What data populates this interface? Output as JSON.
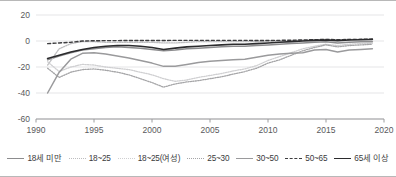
{
  "chart_data": {
    "type": "line",
    "title": "",
    "xlabel": "",
    "ylabel": "",
    "xlim": [
      1990,
      2020
    ],
    "ylim": [
      -60,
      20
    ],
    "xticks": [
      "1990",
      "1995",
      "2000",
      "2005",
      "2010",
      "2015",
      "2020"
    ],
    "yticks": [
      "20",
      "0",
      "-20",
      "-40",
      "-60"
    ],
    "grid": true,
    "legend_position": "bottom",
    "x": [
      1991,
      1992,
      1993,
      1994,
      1995,
      1996,
      1997,
      1998,
      1999,
      2000,
      2001,
      2002,
      2003,
      2004,
      2005,
      2006,
      2007,
      2008,
      2009,
      2010,
      2011,
      2012,
      2013,
      2014,
      2015,
      2016,
      2017,
      2018,
      2019
    ],
    "series": [
      {
        "name": "18세 미만",
        "color": "#8c8c8e",
        "style": "solid",
        "width": 1.5,
        "values": [
          -14.5,
          -11.5,
          -9.0,
          -7.0,
          -6.0,
          -5.0,
          -4.5,
          -5.0,
          -5.5,
          -6.5,
          -7.5,
          -7.0,
          -6.0,
          -5.5,
          -5.0,
          -4.5,
          -4.0,
          -4.0,
          -3.5,
          -3.0,
          -2.5,
          -2.0,
          -1.5,
          -1.0,
          -0.5,
          -1.5,
          -1.0,
          -0.5,
          -0.5
        ]
      },
      {
        "name": "18~25",
        "color": "#bdbdbf",
        "style": "dotted",
        "width": 1.3,
        "values": [
          -18.5,
          -6.0,
          -2.0,
          -0.5,
          -0.5,
          -1.0,
          -1.0,
          -1.0,
          -1.0,
          -1.0,
          -1.5,
          -1.5,
          -1.0,
          -0.5,
          -0.5,
          -0.5,
          -0.5,
          -0.5,
          -0.5,
          0.0,
          0.0,
          0.3,
          0.5,
          1.0,
          1.2,
          1.0,
          1.2,
          1.3,
          1.5
        ]
      },
      {
        "name": "18~25(여성)",
        "color": "#cfcfd1",
        "style": "dotted",
        "width": 1.3,
        "values": [
          -16.0,
          -23.5,
          -20.0,
          -18.0,
          -18.5,
          -20.0,
          -21.0,
          -22.0,
          -24.0,
          -26.0,
          -29.0,
          -31.0,
          -30.0,
          -28.0,
          -26.5,
          -25.0,
          -23.0,
          -21.5,
          -19.0,
          -15.0,
          -12.0,
          -9.0,
          -6.0,
          -4.0,
          -2.5,
          -3.5,
          -2.5,
          -2.0,
          -2.0
        ]
      },
      {
        "name": "25~30",
        "color": "#a5a5a7",
        "style": "dotted",
        "width": 1.3,
        "values": [
          -21.0,
          -28.0,
          -24.0,
          -22.0,
          -21.5,
          -22.5,
          -24.0,
          -26.0,
          -29.0,
          -32.0,
          -35.5,
          -33.0,
          -31.5,
          -30.5,
          -29.0,
          -27.5,
          -25.5,
          -23.5,
          -21.0,
          -17.0,
          -14.5,
          -11.0,
          -7.5,
          -5.0,
          -3.0,
          -4.5,
          -3.5,
          -3.0,
          -2.5
        ]
      },
      {
        "name": "30~50",
        "color": "#9a9a9c",
        "style": "solid",
        "width": 1.5,
        "values": [
          -40.0,
          -24.0,
          -14.0,
          -9.5,
          -9.0,
          -10.0,
          -11.5,
          -13.0,
          -15.0,
          -17.0,
          -19.5,
          -19.5,
          -18.0,
          -16.5,
          -15.5,
          -15.0,
          -14.5,
          -14.0,
          -12.5,
          -11.0,
          -10.0,
          -9.5,
          -9.0,
          -7.0,
          -6.5,
          -8.5,
          -7.0,
          -6.5,
          -6.0
        ]
      },
      {
        "name": "50~65",
        "color": "#3d3d3f",
        "style": "dashed",
        "width": 1.4,
        "values": [
          -2.0,
          -1.5,
          -1.0,
          0.0,
          0.2,
          0.3,
          0.3,
          0.4,
          0.4,
          0.4,
          0.4,
          0.5,
          0.5,
          0.5,
          0.5,
          0.5,
          0.5,
          0.5,
          0.4,
          0.4,
          0.5,
          0.6,
          0.8,
          1.0,
          1.2,
          1.0,
          1.2,
          1.3,
          1.5
        ]
      },
      {
        "name": "65세 이상",
        "color": "#2b2b2d",
        "style": "solid",
        "width": 1.6,
        "values": [
          -13.5,
          -11.0,
          -8.5,
          -6.5,
          -5.0,
          -4.0,
          -3.5,
          -3.5,
          -4.0,
          -5.0,
          -6.5,
          -5.5,
          -4.5,
          -4.0,
          -3.5,
          -3.0,
          -2.5,
          -2.5,
          -2.0,
          -1.5,
          -1.0,
          -0.5,
          0.0,
          0.5,
          0.8,
          0.3,
          0.8,
          1.0,
          1.2
        ]
      }
    ]
  },
  "legend": {
    "items": [
      {
        "label": "18세 미만"
      },
      {
        "label": "18~25"
      },
      {
        "label": "18~25(여성)"
      },
      {
        "label": "25~30"
      },
      {
        "label": "30~50"
      },
      {
        "label": "50~65"
      },
      {
        "label": "65세 이상"
      }
    ]
  }
}
